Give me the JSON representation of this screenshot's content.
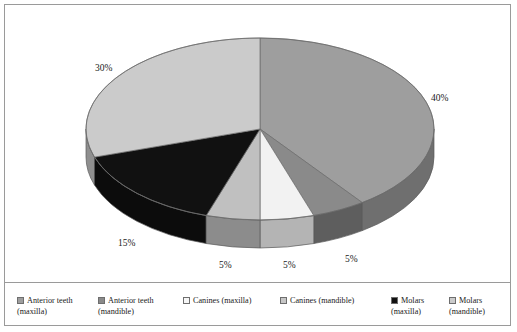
{
  "chart_data": {
    "type": "pie",
    "title": "",
    "three_d": true,
    "start_angle_deg": 0,
    "direction": "clockwise",
    "categories": [
      "Anterior teeth (maxilla)",
      "Canines (mandible)",
      "Canines (maxilla)",
      "Anterior teeth (mandible)",
      "Molars (maxilla)",
      "Molars (mandible)"
    ],
    "values": [
      40,
      5,
      5,
      5,
      15,
      30
    ],
    "value_labels": [
      "40%",
      "5%",
      "5%",
      "5%",
      "15%",
      "30%"
    ],
    "unit": "%",
    "colors": [
      "#9e9e9e",
      "#8a8a8a",
      "#f2f2f2",
      "#c0c0c0",
      "#111111",
      "#cbcbcb"
    ],
    "side_colors": [
      "#6f6f6f",
      "#5e5e5e",
      "#b4b4b4",
      "#8c8c8c",
      "#0c0c0c",
      "#8f8f8f"
    ],
    "legend_position": "bottom",
    "grid": false
  },
  "labels": {
    "p40": "40%",
    "p30": "30%",
    "p15": "15%",
    "p5a": "5%",
    "p5b": "5%",
    "p5c": "5%"
  },
  "legend": {
    "items": [
      {
        "label": "Anterior teeth (maxilla)",
        "color": "#9e9e9e"
      },
      {
        "label": "Anterior teeth (mandible)",
        "color": "#8a8a8a"
      },
      {
        "label": "Canines (maxilla)",
        "color": "#f6f6f6"
      },
      {
        "label": "Canines (mandible)",
        "color": "#c6c6c6"
      },
      {
        "label": "Molars (maxilla)",
        "color": "#111111"
      },
      {
        "label": "Molars (mandible)",
        "color": "#cbcbcb"
      }
    ]
  }
}
